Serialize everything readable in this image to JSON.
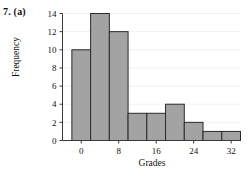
{
  "problem": {
    "label": "7. (a)"
  },
  "chart_data": {
    "type": "bar",
    "title": "",
    "xlabel": "Grades",
    "ylabel": "Frequency",
    "bin_width": 4,
    "bin_starts": [
      -2,
      2,
      6,
      10,
      14,
      18,
      22,
      26,
      30
    ],
    "bin_ends": [
      2,
      6,
      10,
      14,
      18,
      22,
      26,
      30,
      34
    ],
    "categories": [
      "-2 to 2",
      "2 to 6",
      "6 to 10",
      "10 to 14",
      "14 to 18",
      "18 to 22",
      "22 to 26",
      "26 to 30",
      "30 to 34"
    ],
    "values": [
      10,
      14,
      12,
      3,
      3,
      4,
      2,
      1,
      1
    ],
    "xlim": [
      -4,
      34
    ],
    "ylim": [
      0,
      14
    ],
    "xticks": [
      0,
      8,
      16,
      24,
      32
    ],
    "xtick_labels": [
      "0",
      "8",
      "16",
      "24",
      "32"
    ],
    "yticks": [
      0,
      2,
      4,
      6,
      8,
      10,
      12,
      14
    ],
    "ytick_labels": [
      "0",
      "2",
      "4",
      "6",
      "8",
      "10",
      "12",
      "14"
    ],
    "grid": true,
    "legend": false,
    "bar_fill_color": "#a3a3a3",
    "bar_edge_color": "#2b2b2b",
    "axis_color": "#3a3a3a",
    "grid_color": "#f1f1f1"
  }
}
